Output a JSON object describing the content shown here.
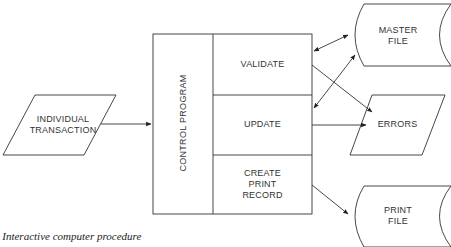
{
  "diagram": {
    "nodes": {
      "individual_transaction": {
        "label_line1": "INDIVIDUAL",
        "label_line2": "TRANSACTION",
        "shape": "parallelogram"
      },
      "control_program": {
        "label": "CONTROL PROGRAM",
        "shape": "rectangle"
      },
      "validate": {
        "label": "VALIDATE",
        "shape": "rectangle"
      },
      "update": {
        "label": "UPDATE",
        "shape": "rectangle"
      },
      "create_print_record": {
        "label_line1": "CREATE",
        "label_line2": "PRINT",
        "label_line3": "RECORD",
        "shape": "rectangle"
      },
      "master_file": {
        "label_line1": "MASTER",
        "label_line2": "FILE",
        "shape": "stored-data"
      },
      "errors": {
        "label": "ERRORS",
        "shape": "parallelogram"
      },
      "print_file": {
        "label_line1": "PRINT",
        "label_line2": "FILE",
        "shape": "stored-data"
      }
    },
    "edges": [
      {
        "from": "individual_transaction",
        "to": "control_program"
      },
      {
        "from": "validate",
        "to": "master_file",
        "bidirectional": true
      },
      {
        "from": "validate",
        "to": "errors"
      },
      {
        "from": "update",
        "to": "master_file",
        "bidirectional": true
      },
      {
        "from": "update",
        "to": "errors"
      },
      {
        "from": "create_print_record",
        "to": "print_file"
      }
    ],
    "caption": "8   Interactive computer procedure",
    "colors": {
      "stroke": "#333333",
      "text": "#333333",
      "background": "#ffffff"
    }
  }
}
